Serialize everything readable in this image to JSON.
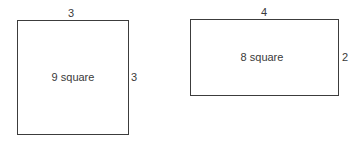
{
  "figures": [
    {
      "kind": "square",
      "top_label": "3",
      "side_label": "3",
      "area_label": "9 square"
    },
    {
      "kind": "rectangle",
      "top_label": "4",
      "side_label": "2",
      "area_label": "8 square"
    }
  ]
}
